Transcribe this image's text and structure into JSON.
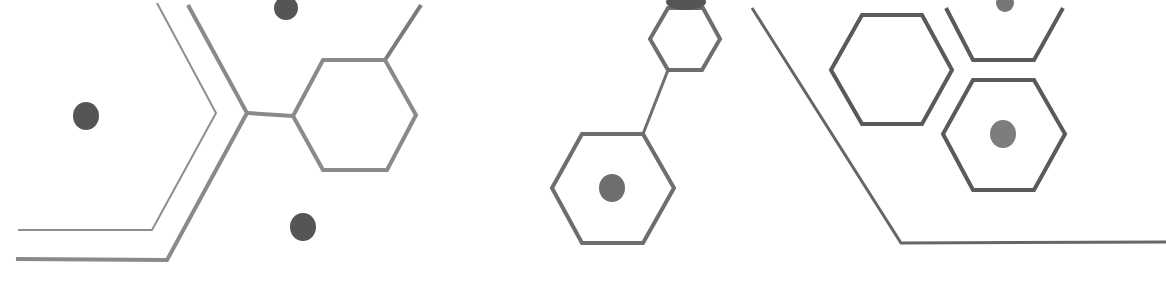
{
  "graphic": {
    "description": "Decorative molecular hexagon line-art pattern",
    "width": 1166,
    "height": 288,
    "colors": {
      "background": "#ffffff",
      "line_light": "#8a8a8a",
      "line_mid": "#7a7a7a",
      "line_dark": "#5e5e5e",
      "dot_dark": "#555555",
      "dot_light": "#7d7d7d"
    },
    "polylines": [
      {
        "name": "left-thin-chevron",
        "points": "157,3 216,113 152,230 18,230",
        "stroke": "#8e8e8e",
        "width": 2
      },
      {
        "name": "left-thick-chevron",
        "points": "188,5 247,113 167,260 16,259",
        "stroke": "#8a8a8a",
        "width": 4
      },
      {
        "name": "left-connector",
        "points": "247,113 293,116",
        "stroke": "#8a8a8a",
        "width": 4
      },
      {
        "name": "left-hex-stem",
        "points": "385,60 421,5",
        "stroke": "#7a7a7a",
        "width": 4
      },
      {
        "name": "middle-link",
        "points": "668,70 643,134",
        "stroke": "#6e6e6e",
        "width": 3
      },
      {
        "name": "right-long-line",
        "points": "752,8 901,243 1166,242",
        "stroke": "#666666",
        "width": 3
      },
      {
        "name": "right-partial-hex",
        "points": "946,8 973,60 1034,60 1063,8",
        "stroke": "#5a5a5a",
        "width": 4
      }
    ],
    "hexagons": [
      {
        "name": "left-hexagon",
        "points": "323,60 385,60 416,115 387,170 323,170 293,116",
        "stroke": "#8a8a8a",
        "width": 4
      },
      {
        "name": "middle-small-hexagon",
        "points": "668,8 703,8 720,39 702,70 668,70 650,39",
        "stroke": "#6e6e6e",
        "width": 4
      },
      {
        "name": "middle-large-hexagon",
        "points": "582,134 643,134 674,188 643,243 582,243 552,188",
        "stroke": "#6e6e6e",
        "width": 4
      },
      {
        "name": "right-upper-hexagon",
        "points": "862,15 922,15 952,70 922,124 862,124 831,70",
        "stroke": "#5a5a5a",
        "width": 4
      },
      {
        "name": "right-lower-hexagon",
        "points": "973,80 1034,80 1065,134 1034,190 973,190 943,134",
        "stroke": "#5a5a5a",
        "width": 4
      }
    ],
    "dots": [
      {
        "name": "left-dot",
        "cx": 86,
        "cy": 116,
        "rx": 13,
        "ry": 14,
        "fill": "#555555"
      },
      {
        "name": "lower-dot",
        "cx": 303,
        "cy": 227,
        "rx": 13,
        "ry": 14,
        "fill": "#555555"
      },
      {
        "name": "top-dot",
        "cx": 286,
        "cy": 8,
        "rx": 12,
        "ry": 12,
        "fill": "#555555"
      },
      {
        "name": "middle-hex-dot",
        "cx": 612,
        "cy": 188,
        "rx": 13,
        "ry": 14,
        "fill": "#6e6e6e"
      },
      {
        "name": "right-hex-dot",
        "cx": 1003,
        "cy": 134,
        "rx": 13,
        "ry": 14,
        "fill": "#7d7d7d"
      },
      {
        "name": "right-top-dot",
        "cx": 1005,
        "cy": 3,
        "rx": 9,
        "ry": 9,
        "fill": "#777777"
      },
      {
        "name": "middle-top-blob",
        "cx": 686,
        "cy": 2,
        "rx": 20,
        "ry": 8,
        "fill": "#555555"
      }
    ]
  }
}
